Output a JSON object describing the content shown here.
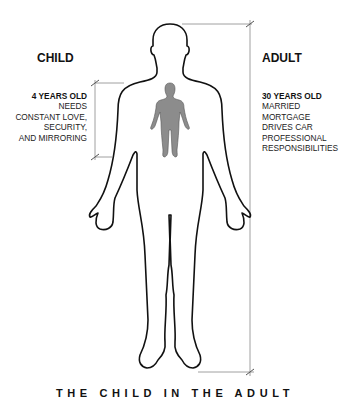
{
  "title": "THE CHILD IN THE ADULT",
  "child": {
    "heading": "CHILD",
    "age": "4 YEARS OLD",
    "lines": [
      "NEEDS",
      "CONSTANT LOVE,",
      "SECURITY,",
      "AND MIRRORING"
    ]
  },
  "adult": {
    "heading": "ADULT",
    "age": "30 YEARS OLD",
    "lines": [
      "MARRIED",
      "MORTGAGE",
      "DRIVES CAR",
      "PROFESSIONAL",
      "RESPONSIBILITIES"
    ]
  },
  "colors": {
    "outline": "#111111",
    "child_figure_fill": "#8c8c8c",
    "measure_line": "#a0a0a0",
    "background": "#ffffff"
  },
  "icons": {
    "adult_figure": "adult-body-outline-icon",
    "child_figure": "child-body-silhouette-icon"
  }
}
